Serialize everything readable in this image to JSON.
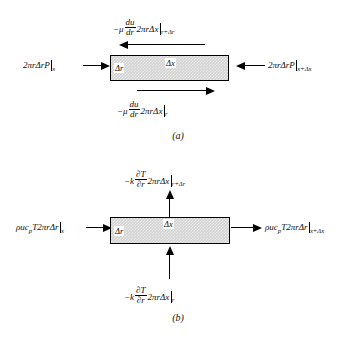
{
  "figure": {
    "panels": [
      {
        "id": "a",
        "caption": "(a)",
        "box": {
          "delta_r_label": "Δr",
          "delta_x_label": "Δx"
        },
        "labels": {
          "top": {
            "name": "shear-stress-outer",
            "coef": "−μ",
            "frac_num": "du",
            "frac_den": "dr",
            "rest": "2πrΔx",
            "eval_at": "r+Δr",
            "direction": "left"
          },
          "bottom": {
            "name": "shear-stress-inner",
            "coef": "−μ",
            "frac_num": "du",
            "frac_den": "dr",
            "rest": "2πrΔx",
            "eval_at": "r",
            "direction": "right"
          },
          "left": {
            "name": "pressure-force-inlet",
            "expr": "2πrΔrP",
            "eval_at": "x",
            "direction": "right"
          },
          "right": {
            "name": "pressure-force-outlet",
            "expr": "2πrΔrP",
            "eval_at": "x+Δx",
            "direction": "left"
          }
        }
      },
      {
        "id": "b",
        "caption": "(b)",
        "box": {
          "delta_r_label": "Δr",
          "delta_x_label": "Δx"
        },
        "labels": {
          "top": {
            "name": "conduction-outer",
            "coef": "−k",
            "frac_num": "∂T",
            "frac_den": "∂r",
            "rest": "2πrΔx",
            "eval_at": "r+Δr",
            "direction": "up"
          },
          "bottom": {
            "name": "conduction-inner",
            "coef": "−k",
            "frac_num": "∂T",
            "frac_den": "∂r",
            "rest": "2πrΔx",
            "eval_at": "r",
            "direction": "up"
          },
          "left": {
            "name": "convection-inlet",
            "expr": "ρuc",
            "sub": "p",
            "expr2": "T2πrΔr",
            "eval_at": "x",
            "direction": "right"
          },
          "right": {
            "name": "convection-outlet",
            "expr": "ρuc",
            "sub": "p",
            "expr2": "T2πrΔr",
            "eval_at": "x+Δx",
            "direction": "right"
          }
        }
      }
    ],
    "colors": {
      "line": "#000000",
      "box_fill": "#d2d2d2",
      "background": "#ffffff"
    }
  }
}
